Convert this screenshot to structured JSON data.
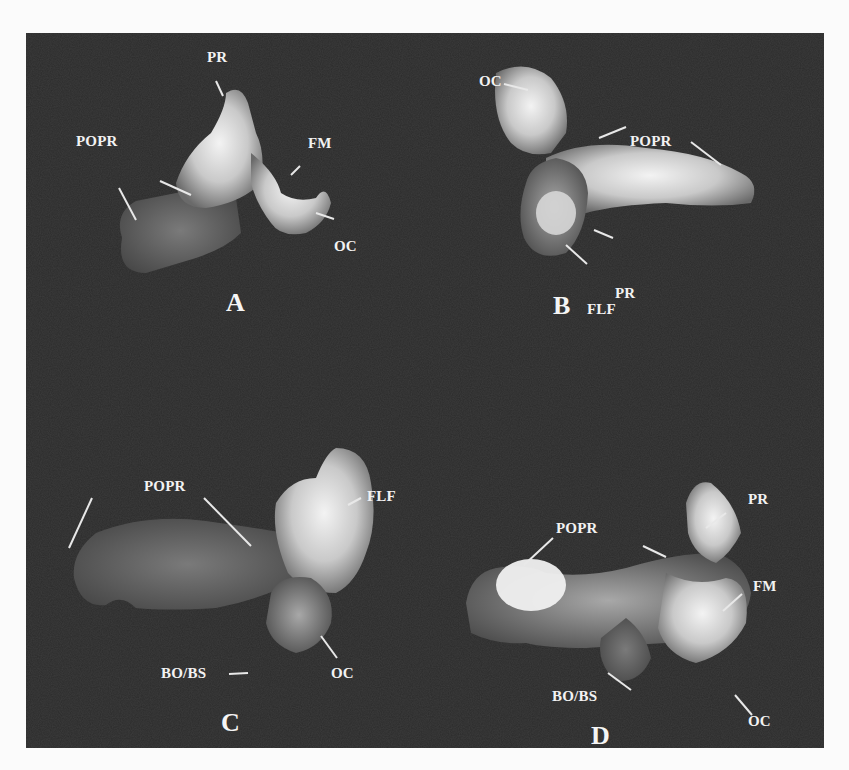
{
  "figure": {
    "panels": [
      {
        "letter": "A",
        "labels": [
          "PR",
          "POPR",
          "POPR",
          "FM",
          "OC"
        ]
      },
      {
        "letter": "B",
        "labels": [
          "OC",
          "POPR",
          "PR",
          "FLF"
        ]
      },
      {
        "letter": "C",
        "labels": [
          "POPR",
          "FLF",
          "BO/BS",
          "OC"
        ]
      },
      {
        "letter": "D",
        "labels": [
          "PR",
          "POPR",
          "FM",
          "BO/BS",
          "OC"
        ]
      }
    ]
  }
}
